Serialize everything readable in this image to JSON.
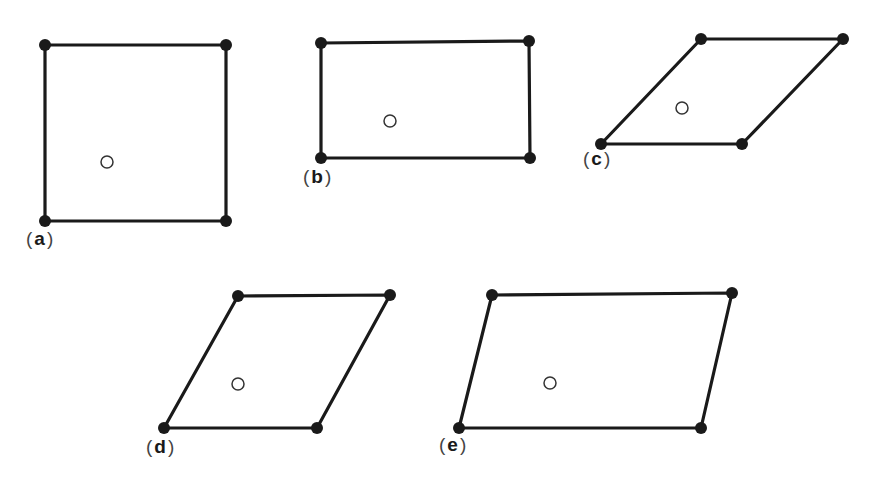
{
  "figure": {
    "colors": {
      "line": "#1a1a1a",
      "lattice_point": "#1a1a1a",
      "open_circle": "#333333",
      "background": "#ffffff"
    },
    "cells": [
      {
        "id": "a",
        "label_open": "(",
        "label_letter": "a",
        "label_close": ")",
        "shape": "square",
        "corners": [
          [
            45,
            45
          ],
          [
            226,
            45
          ],
          [
            226,
            221
          ],
          [
            45,
            221
          ]
        ],
        "open_circle": [
          107,
          162
        ],
        "label_pos": [
          26,
          228
        ]
      },
      {
        "id": "b",
        "label_open": "(",
        "label_letter": "b",
        "label_close": ")",
        "shape": "rectangle",
        "corners": [
          [
            321,
            43
          ],
          [
            529,
            41
          ],
          [
            530,
            158
          ],
          [
            321,
            158
          ]
        ],
        "open_circle": [
          390,
          121
        ],
        "label_pos": [
          303,
          166
        ]
      },
      {
        "id": "c",
        "label_open": "(",
        "label_letter": "c",
        "label_close": ")",
        "shape": "rhombus",
        "corners": [
          [
            701,
            39
          ],
          [
            843,
            39
          ],
          [
            742,
            144
          ],
          [
            601,
            144
          ]
        ],
        "open_circle": [
          682,
          108
        ],
        "label_pos": [
          583,
          148
        ]
      },
      {
        "id": "d",
        "label_open": "(",
        "label_letter": "d",
        "label_close": ")",
        "shape": "rhombus",
        "corners": [
          [
            238,
            296
          ],
          [
            390,
            295
          ],
          [
            317,
            428
          ],
          [
            164,
            428
          ]
        ],
        "open_circle": [
          238,
          384
        ],
        "label_pos": [
          146,
          436
        ]
      },
      {
        "id": "e",
        "label_open": "(",
        "label_letter": "e",
        "label_close": ")",
        "shape": "parallelogram",
        "corners": [
          [
            492,
            295
          ],
          [
            732,
            293
          ],
          [
            701,
            428
          ],
          [
            459,
            428
          ]
        ],
        "open_circle": [
          550,
          383
        ],
        "label_pos": [
          439,
          434
        ]
      }
    ]
  }
}
